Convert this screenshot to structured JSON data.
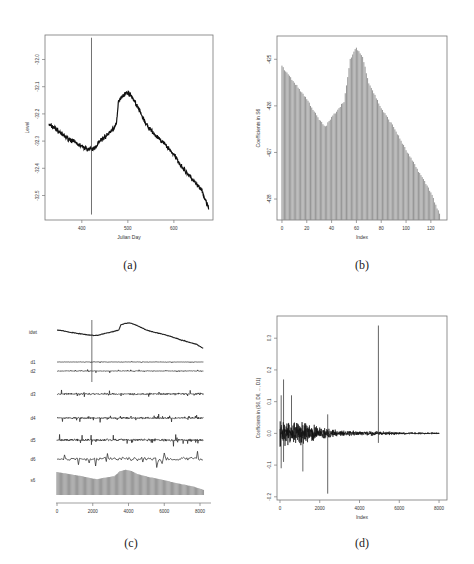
{
  "chart_data": [
    {
      "id": "a",
      "type": "line",
      "caption": "(a)",
      "title": "",
      "xlabel": "Julian Day",
      "ylabel": "Level",
      "xticks": [
        400,
        500,
        600
      ],
      "yticks": [
        "-32.0",
        "-32.1",
        "-32.2",
        "-32.3",
        "-32.4",
        "-32.5"
      ],
      "xlim": [
        320,
        685
      ],
      "ylim": [
        -32.59,
        -31.91
      ],
      "vline_x": 421,
      "vline_range": [
        -32.57,
        -31.92
      ],
      "series": [
        {
          "name": "Level",
          "x": [
            328,
            340,
            360,
            380,
            400,
            415,
            425,
            440,
            460,
            475,
            480,
            490,
            500,
            510,
            520,
            540,
            560,
            580,
            600,
            620,
            640,
            660,
            676
          ],
          "y": [
            -32.24,
            -32.25,
            -32.28,
            -32.3,
            -32.32,
            -32.33,
            -32.33,
            -32.3,
            -32.27,
            -32.24,
            -32.15,
            -32.13,
            -32.12,
            -32.14,
            -32.17,
            -32.24,
            -32.28,
            -32.31,
            -32.35,
            -32.4,
            -32.44,
            -32.48,
            -32.55
          ]
        }
      ]
    },
    {
      "id": "b",
      "type": "bar",
      "caption": "(b)",
      "title": "",
      "xlabel": "Index",
      "ylabel": "Coefficients in S6",
      "xticks": [
        0,
        20,
        40,
        60,
        80,
        100,
        120
      ],
      "yticks": [
        "-425",
        "-426",
        "-427",
        "-428"
      ],
      "xlim": [
        -4,
        133
      ],
      "ylim": [
        -428.45,
        -424.5
      ],
      "baseline": -428.45,
      "values_keypoints": {
        "x": [
          0,
          10,
          20,
          30,
          35,
          40,
          50,
          53,
          55,
          60,
          65,
          70,
          80,
          90,
          100,
          110,
          120,
          128
        ],
        "y": [
          -425.15,
          -425.5,
          -425.85,
          -426.3,
          -426.45,
          -426.25,
          -425.9,
          -425.4,
          -425.0,
          -424.75,
          -424.95,
          -425.5,
          -426.05,
          -426.45,
          -426.95,
          -427.4,
          -427.85,
          -428.4
        ]
      },
      "n_bars": 128
    },
    {
      "id": "c",
      "type": "line",
      "caption": "(c)",
      "title": "",
      "xlabel": "",
      "ylabel": "",
      "xticks": [
        0,
        2000,
        4000,
        6000,
        8000
      ],
      "xlim": [
        0,
        8192
      ],
      "vline_x": 1950,
      "rows": [
        {
          "label": "idwt",
          "kind": "signal"
        },
        {
          "label": "d1",
          "kind": "detail",
          "amp": 0.5
        },
        {
          "label": "d2",
          "kind": "detail",
          "amp": 1.0
        },
        {
          "label": "d3",
          "kind": "detail",
          "amp": 2.5
        },
        {
          "label": "d4",
          "kind": "detail",
          "amp": 2.5
        },
        {
          "label": "d5",
          "kind": "detail",
          "amp": 3.5
        },
        {
          "label": "d6",
          "kind": "detail",
          "amp": 6.0
        },
        {
          "label": "s6",
          "kind": "smooth"
        }
      ]
    },
    {
      "id": "d",
      "type": "line",
      "caption": "(d)",
      "title": "",
      "xlabel": "Index",
      "ylabel": "Coefficients in (S6, D6, ..., D1)",
      "xticks": [
        0,
        2000,
        4000,
        6000,
        8000
      ],
      "yticks": [
        "0.3",
        "0.2",
        "0.1",
        "0.0",
        "-0.1",
        "-0.2"
      ],
      "ytick_values": [
        0.3,
        0.2,
        0.1,
        0.0,
        -0.1,
        -0.2
      ],
      "xlim": [
        -150,
        8400
      ],
      "ylim": [
        -0.21,
        0.37
      ],
      "spikes": [
        {
          "x": 60,
          "y": 0.12
        },
        {
          "x": 60,
          "y": -0.11
        },
        {
          "x": 180,
          "y": 0.17
        },
        {
          "x": 180,
          "y": -0.09
        },
        {
          "x": 580,
          "y": 0.12
        },
        {
          "x": 1150,
          "y": -0.12
        },
        {
          "x": 2400,
          "y": 0.06
        },
        {
          "x": 2400,
          "y": -0.19
        },
        {
          "x": 4950,
          "y": 0.34
        },
        {
          "x": 4950,
          "y": -0.03
        }
      ],
      "envelope": {
        "x": [
          0,
          500,
          1000,
          1500,
          2000,
          2500,
          3000,
          4000,
          5000,
          6000,
          7000,
          8000
        ],
        "amp": [
          0.06,
          0.05,
          0.05,
          0.04,
          0.025,
          0.02,
          0.012,
          0.01,
          0.008,
          0.005,
          0.004,
          0.004
        ]
      }
    }
  ]
}
